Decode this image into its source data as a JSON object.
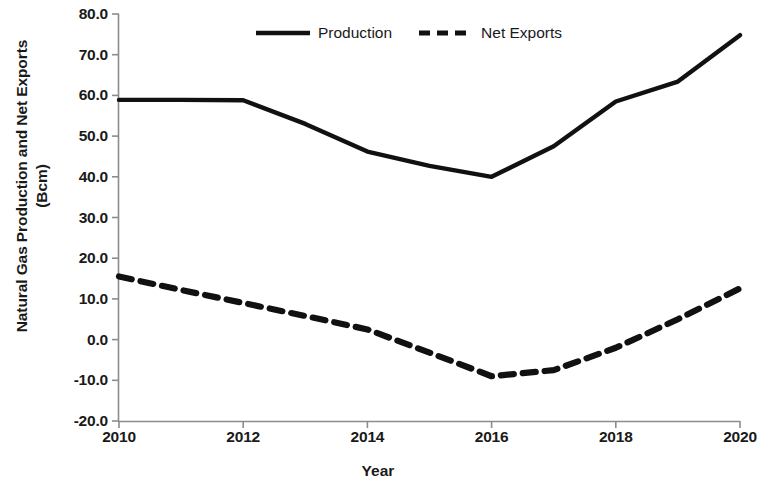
{
  "chart_data": {
    "type": "line",
    "title": "",
    "xlabel": "Year",
    "ylabel": "Natural Gas Production and Net Exports (Bcm)",
    "ylabel_line1": "Natural Gas Production and Net Exports",
    "ylabel_line2": "(Bcm)",
    "x": [
      2010,
      2011,
      2012,
      2013,
      2014,
      2015,
      2016,
      2017,
      2018,
      2019,
      2020
    ],
    "xlim": [
      2010,
      2020
    ],
    "ylim": [
      -20.0,
      80.0
    ],
    "xticks": [
      2010,
      2012,
      2014,
      2016,
      2018,
      2020
    ],
    "xtick_labels": [
      "2010",
      "2012",
      "2014",
      "2016",
      "2018",
      "2020"
    ],
    "yticks": [
      -20.0,
      -10.0,
      0.0,
      10.0,
      20.0,
      30.0,
      40.0,
      50.0,
      60.0,
      70.0,
      80.0
    ],
    "ytick_labels": [
      "-20.0",
      "-10.0",
      "0.0",
      "10.0",
      "20.0",
      "30.0",
      "40.0",
      "50.0",
      "60.0",
      "70.0",
      "80.0"
    ],
    "grid": false,
    "legend_position": "top-center",
    "series": [
      {
        "name": "Production",
        "style": "solid",
        "color": "#111111",
        "values": [
          58.9,
          58.9,
          58.8,
          53.0,
          46.2,
          42.7,
          40.0,
          47.5,
          58.5,
          63.4,
          74.8
        ]
      },
      {
        "name": "Net Exports",
        "style": "dashed",
        "color": "#111111",
        "values": [
          15.5,
          12.2,
          9.0,
          5.8,
          2.5,
          -3.2,
          -9.0,
          -7.5,
          -2.0,
          5.0,
          12.6
        ]
      }
    ]
  },
  "legend": {
    "items": [
      {
        "label": "Production",
        "style": "solid"
      },
      {
        "label": "Net Exports",
        "style": "dashed"
      }
    ]
  },
  "axes": {
    "x_title": "Year",
    "y_title_line1": "Natural Gas Production and Net Exports",
    "y_title_line2": "(Bcm)"
  }
}
